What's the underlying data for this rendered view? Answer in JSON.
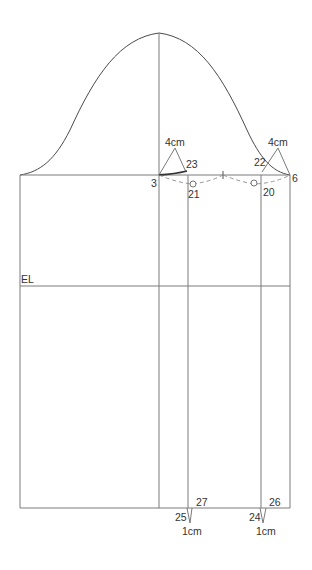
{
  "diagram": {
    "type": "sleeve-pattern-draft",
    "colors": {
      "line": "#7a7a7a",
      "curve": "#4a4a4a",
      "text": "#333333"
    },
    "labels": {
      "el": "EL",
      "p3": "3",
      "p6": "6",
      "p20": "20",
      "p21": "21",
      "p22": "22",
      "p23": "23",
      "p24": "24",
      "p25": "25",
      "p26": "26",
      "p27": "27",
      "dart_left_top": "4cm",
      "dart_right_top": "4cm",
      "dart_left_bottom": "1cm",
      "dart_right_bottom": "1cm"
    }
  }
}
